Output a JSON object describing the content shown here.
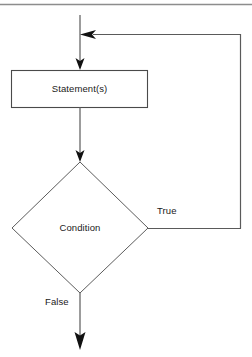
{
  "diagram": {
    "type": "flowchart",
    "background_color": "#ffffff",
    "line_color": "#3a3a3a",
    "text_color": "#1a1a1a",
    "top_rule": {
      "name": "top-horizontal-rule",
      "color": "#8d8d8d",
      "y": 4
    },
    "nodes": {
      "statement": {
        "label": "Statement(s)",
        "shape": "rectangle"
      },
      "condition": {
        "label": "Condition",
        "shape": "diamond"
      }
    },
    "edges": {
      "true_branch": {
        "label": "True"
      },
      "false_branch": {
        "label": "False"
      }
    }
  }
}
